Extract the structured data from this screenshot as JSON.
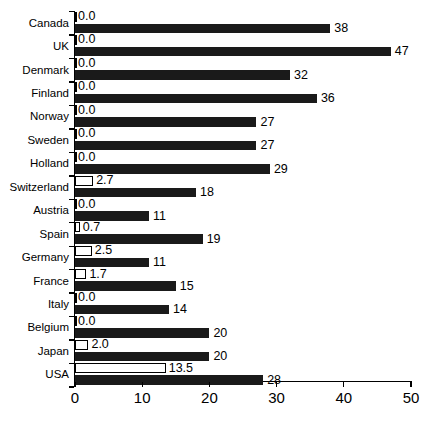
{
  "chart_data": {
    "type": "bar",
    "orientation": "horizontal",
    "title": "",
    "xlabel": "",
    "ylabel": "",
    "xlim": [
      0,
      50
    ],
    "xticks": [
      0,
      10,
      20,
      30,
      40,
      50
    ],
    "grid": false,
    "legend": "none",
    "categories": [
      "Canada",
      "UK",
      "Denmark",
      "Finland",
      "Norway",
      "Sweden",
      "Holland",
      "Switzerland",
      "Austria",
      "Spain",
      "Germany",
      "France",
      "Italy",
      "Belgium",
      "Japan",
      "USA"
    ],
    "series": [
      {
        "name": "outlined-bar",
        "style": "white-filled-black-outline",
        "values": [
          0.0,
          0.0,
          0.0,
          0.0,
          0.0,
          0.0,
          0.0,
          2.7,
          0.0,
          0.7,
          2.5,
          1.7,
          0.0,
          0.0,
          2.0,
          13.5
        ],
        "labels": [
          "0.0",
          "0.0",
          "0.0",
          "0.0",
          "0.0",
          "0.0",
          "0.0",
          "2.7",
          "0.0",
          "0.7",
          "2.5",
          "1.7",
          "0.0",
          "0.0",
          "2.0",
          "13.5"
        ]
      },
      {
        "name": "solid-bar",
        "style": "solid-black",
        "values": [
          38,
          47,
          32,
          36,
          27,
          27,
          29,
          18,
          11,
          19,
          11,
          15,
          14,
          20,
          20,
          28
        ],
        "labels": [
          "38",
          "47",
          "32",
          "36",
          "27",
          "27",
          "29",
          "18",
          "11",
          "19",
          "11",
          "15",
          "14",
          "20",
          "20",
          "28"
        ]
      }
    ]
  },
  "axis": {
    "tick_labels": [
      "0",
      "10",
      "20",
      "30",
      "40",
      "50"
    ]
  }
}
